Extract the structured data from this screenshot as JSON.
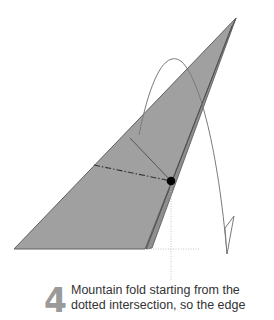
{
  "step": {
    "number": "4",
    "instruction_lines": [
      "Mountain fold starting from the",
      "dotted intersection, so the edge"
    ]
  },
  "colors": {
    "paper_fill": "#a0a0a0",
    "edge_stroke": "#555555",
    "arrow_stroke": "#7a7a7a",
    "dot": "#000000",
    "guide_dotted": "#c8c8c8",
    "step_number": "#9a9a9a",
    "text": "#333333"
  }
}
